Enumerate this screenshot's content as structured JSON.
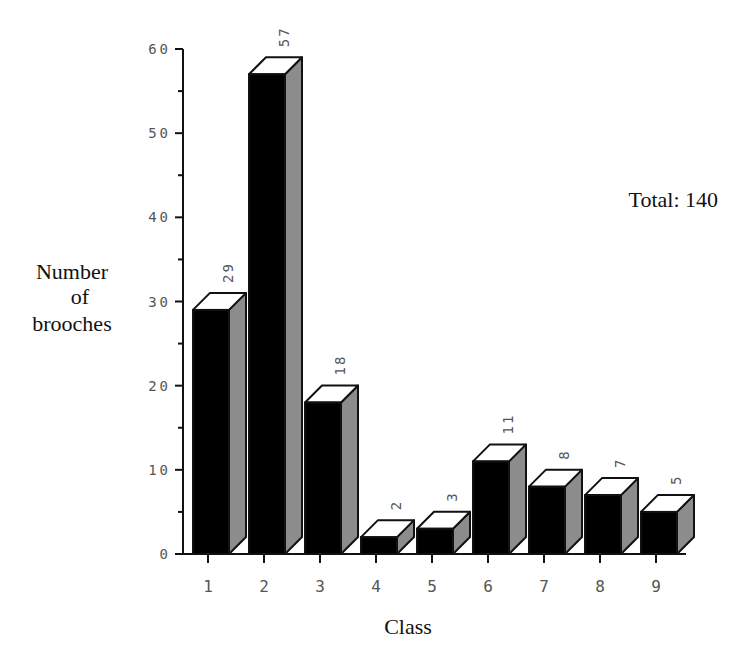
{
  "chart_data": {
    "type": "bar",
    "title": "",
    "xlabel": "Class",
    "ylabel": "Number of brooches",
    "ylabel_lines": [
      "Number",
      "of",
      "brooches"
    ],
    "categories": [
      "1",
      "2",
      "3",
      "4",
      "5",
      "6",
      "7",
      "8",
      "9"
    ],
    "values": [
      29,
      57,
      18,
      2,
      3,
      11,
      8,
      7,
      5
    ],
    "ylim": [
      0,
      60
    ],
    "yticks": [
      0,
      10,
      20,
      30,
      40,
      50,
      60
    ],
    "minor_tick_step": 5,
    "annotation": "Total: 140",
    "grid": false,
    "style": "3d-bar",
    "colors": {
      "front": "#000000",
      "side": "#8c8c8c",
      "top": "#ffffff",
      "axis": "#111111",
      "tick_label": "#555555"
    }
  }
}
